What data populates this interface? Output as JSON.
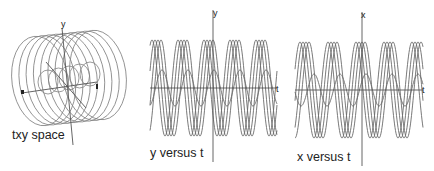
{
  "panels": {
    "txy": {
      "caption": "txy space",
      "axis_labels": {
        "y": "y",
        "t": "t",
        "x": "x"
      }
    },
    "y_vs_t": {
      "caption": "y versus t",
      "axis_labels": {
        "vertical": "y",
        "horizontal": "t"
      }
    },
    "x_vs_t": {
      "caption": "x versus t",
      "axis_labels": {
        "vertical": "x",
        "horizontal": "t"
      }
    }
  },
  "chart_data": [
    {
      "type": "line",
      "title": "y versus t",
      "xlabel": "t",
      "ylabel": "y",
      "grid": false,
      "plot_box": {
        "x0": 150,
        "x1": 277,
        "axis_x": 213,
        "axis_y": 88,
        "vaxis_top": 10,
        "vaxis_bottom": 162
      },
      "series": [
        {
          "name": "large-1",
          "amplitude": 48,
          "period": 26,
          "phase": 0
        },
        {
          "name": "large-2",
          "amplitude": 48,
          "period": 26,
          "phase": 3
        },
        {
          "name": "large-3",
          "amplitude": 48,
          "period": 26,
          "phase": 6
        },
        {
          "name": "large-4",
          "amplitude": 48,
          "period": 26,
          "phase": 9
        },
        {
          "name": "small",
          "amplitude": 18,
          "period": 26,
          "phase": 10
        }
      ],
      "peak_offset": 152
    },
    {
      "type": "line",
      "title": "x versus t",
      "xlabel": "t",
      "ylabel": "x",
      "grid": false,
      "plot_box": {
        "x0": 295,
        "x1": 423,
        "axis_x": 362,
        "axis_y": 90,
        "vaxis_top": 12,
        "vaxis_bottom": 166
      },
      "series": [
        {
          "name": "large-1",
          "amplitude": 48,
          "period": 28,
          "phase": 0
        },
        {
          "name": "large-2",
          "amplitude": 48,
          "period": 28,
          "phase": 3
        },
        {
          "name": "large-3",
          "amplitude": 48,
          "period": 28,
          "phase": 6
        },
        {
          "name": "large-4",
          "amplitude": 48,
          "period": 28,
          "phase": 9
        },
        {
          "name": "small",
          "amplitude": 16,
          "period": 26,
          "phase": 14
        }
      ],
      "peak_offset": 300
    }
  ],
  "helix": {
    "rings": 9,
    "start_cx": 40,
    "end_cx": 98,
    "cy": 78,
    "rx": 28,
    "ry": 45,
    "inner_loops": 5,
    "inner_start_cx": 48,
    "inner_end_cx": 90,
    "inner_cy": 78,
    "inner_r": 10
  }
}
